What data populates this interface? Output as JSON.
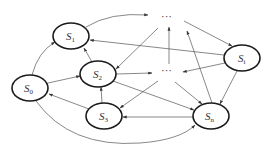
{
  "diagram": {
    "type": "directed-state-graph",
    "nodes": [
      {
        "id": "S0",
        "base": "S",
        "sub": "0",
        "cx": 30,
        "cy": 88,
        "rx": 18,
        "ry": 13
      },
      {
        "id": "S1",
        "base": "S",
        "sub": "1",
        "cx": 71,
        "cy": 36,
        "rx": 18,
        "ry": 13
      },
      {
        "id": "S2",
        "base": "S",
        "sub": "2",
        "cx": 98,
        "cy": 74,
        "rx": 18,
        "ry": 13
      },
      {
        "id": "S3",
        "base": "S",
        "sub": "3",
        "cx": 104,
        "cy": 116,
        "rx": 18,
        "ry": 13
      },
      {
        "id": "Si",
        "base": "S",
        "sub": "i",
        "cx": 242,
        "cy": 58,
        "rx": 18,
        "ry": 13
      },
      {
        "id": "Sn",
        "base": "S",
        "sub": "n",
        "cx": 211,
        "cy": 116,
        "rx": 18,
        "ry": 13
      },
      {
        "id": "D1",
        "label": "···",
        "cx": 169,
        "cy": 18
      },
      {
        "id": "D2",
        "label": "···",
        "cx": 169,
        "cy": 71
      }
    ],
    "edges": [
      {
        "from": "S0",
        "to": "S1"
      },
      {
        "from": "S0",
        "to": "S2"
      },
      {
        "from": "S0",
        "to": "Sn"
      },
      {
        "from": "S1",
        "to": "D1"
      },
      {
        "from": "S2",
        "to": "S1"
      },
      {
        "from": "S2",
        "to": "D2"
      },
      {
        "from": "S2",
        "to": "Sn"
      },
      {
        "from": "S3",
        "to": "S0"
      },
      {
        "from": "S3",
        "to": "S2"
      },
      {
        "from": "D1",
        "to": "S2"
      },
      {
        "from": "D1",
        "to": "Si"
      },
      {
        "from": "D2",
        "to": "D1"
      },
      {
        "from": "D2",
        "to": "S3"
      },
      {
        "from": "D2",
        "to": "Sn"
      },
      {
        "from": "Si",
        "to": "S1"
      },
      {
        "from": "Si",
        "to": "D2"
      },
      {
        "from": "Si",
        "to": "Sn"
      },
      {
        "from": "Sn",
        "to": "S3"
      },
      {
        "from": "Sn",
        "to": "D1"
      }
    ]
  },
  "labels": {
    "S0": {
      "base": "S",
      "sub": "0"
    },
    "S1": {
      "base": "S",
      "sub": "1"
    },
    "S2": {
      "base": "S",
      "sub": "2"
    },
    "S3": {
      "base": "S",
      "sub": "3"
    },
    "Si": {
      "base": "S",
      "sub": "i"
    },
    "Sn": {
      "base": "S",
      "sub": "n"
    },
    "dots_top": "···",
    "dots_mid": "···"
  },
  "colors": {
    "node_stroke": "#1a1a1a",
    "edge_stroke": "#555555",
    "background": "#ffffff"
  }
}
